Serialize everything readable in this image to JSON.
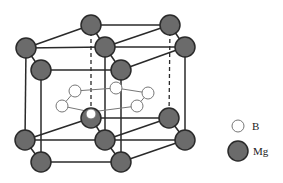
{
  "figure": {
    "colors": {
      "mg_fill": "#6b6b6b",
      "mg_stroke": "#2a2a2a",
      "b_fill": "#ffffff",
      "b_stroke": "#777777",
      "bond": "#2a2a2a"
    },
    "mg_atoms": [
      [
        91,
        25
      ],
      [
        170,
        25
      ],
      [
        26,
        48
      ],
      [
        105,
        47
      ],
      [
        185,
        47
      ],
      [
        41,
        70
      ],
      [
        121,
        70
      ],
      [
        91,
        118
      ],
      [
        169,
        118
      ],
      [
        25,
        140
      ],
      [
        105,
        140
      ],
      [
        185,
        140
      ],
      [
        41,
        162
      ],
      [
        121,
        162
      ]
    ],
    "b_atoms": [
      [
        75,
        91
      ],
      [
        116,
        88
      ],
      [
        148,
        93
      ],
      [
        62,
        106
      ],
      [
        137,
        106
      ],
      [
        91,
        115
      ]
    ]
  },
  "legend": {
    "items": [
      {
        "label": "B",
        "type": "boron"
      },
      {
        "label": "Mg",
        "type": "magnesium"
      }
    ]
  }
}
